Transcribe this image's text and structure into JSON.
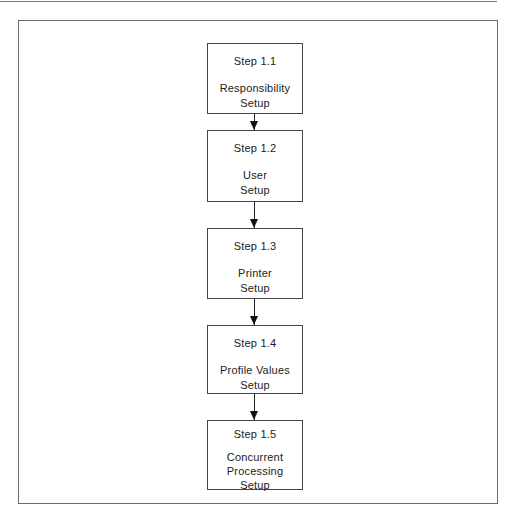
{
  "diagram": {
    "type": "vertical-flowchart",
    "steps": [
      {
        "number": "Step 1.1",
        "title": "Responsibility\nSetup"
      },
      {
        "number": "Step 1.2",
        "title": "User\nSetup"
      },
      {
        "number": "Step 1.3",
        "title": "Printer\nSetup"
      },
      {
        "number": "Step 1.4",
        "title": "Profile Values\nSetup"
      },
      {
        "number": "Step 1.5",
        "title": "Concurrent\nProcessing\nSetup"
      }
    ],
    "connections": [
      {
        "from": "Step 1.1",
        "to": "Step 1.2"
      },
      {
        "from": "Step 1.2",
        "to": "Step 1.3"
      },
      {
        "from": "Step 1.3",
        "to": "Step 1.4"
      },
      {
        "from": "Step 1.4",
        "to": "Step 1.5"
      }
    ],
    "colors": {
      "box_border": "#444444",
      "frame_border": "#6b6b6b",
      "arrow": "#222222",
      "text": "#222222",
      "background": "#ffffff"
    }
  }
}
